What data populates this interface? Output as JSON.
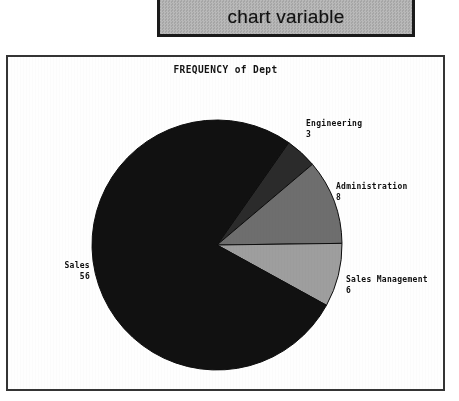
{
  "header": {
    "label": "chart variable"
  },
  "chart_frame": {
    "title": "FREQUENCY of Dept"
  },
  "chart_data": {
    "type": "pie",
    "title": "FREQUENCY of Dept",
    "xlabel": "",
    "ylabel": "",
    "legend_position": "outside-labels",
    "grid": false,
    "total": 73,
    "start_angle_deg": -55,
    "direction": "clockwise",
    "categories": [
      "Engineering",
      "Administration",
      "Sales Management",
      "Sales"
    ],
    "values": [
      3,
      8,
      6,
      56
    ],
    "colors": [
      "#2b2b2b",
      "#6e6e6e",
      "#9e9e9e",
      "#111111"
    ],
    "slices": [
      {
        "label": "Engineering",
        "value": 3,
        "color": "#2b2b2b"
      },
      {
        "label": "Administration",
        "value": 8,
        "color": "#6e6e6e"
      },
      {
        "label": "Sales Management",
        "value": 6,
        "color": "#9e9e9e"
      },
      {
        "label": "Sales",
        "value": 56,
        "color": "#111111"
      }
    ]
  },
  "labels": {
    "engineering": {
      "name": "Engineering",
      "value": "3"
    },
    "administration": {
      "name": "Administration",
      "value": "8"
    },
    "sales_management": {
      "name": "Sales Management",
      "value": "6"
    },
    "sales": {
      "name": "Sales",
      "value": "56"
    }
  }
}
